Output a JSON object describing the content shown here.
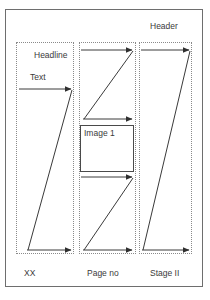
{
  "diagram": {
    "title_label": "Header",
    "frame": {
      "name": "page-frame"
    },
    "columns": [
      {
        "id": "left",
        "bottom_label": "XX",
        "inner_labels": [
          "Headline",
          "Text"
        ]
      },
      {
        "id": "middle",
        "bottom_label": "Page no",
        "inner_labels": [
          "Image 1"
        ]
      },
      {
        "id": "right",
        "bottom_label": "Stage II",
        "inner_labels": []
      }
    ],
    "labels": {
      "header": "Header",
      "headline": "Headline",
      "text": "Text",
      "image_1": "Image 1",
      "bottom_left": "XX",
      "bottom_middle": "Page no",
      "bottom_right": "Stage II"
    },
    "colors": {
      "frame_stroke": "#6e6e6e",
      "column_stroke": "#8a8a8a",
      "arrow_stroke": "#3a3a3a",
      "box_stroke": "#4a4a4a",
      "text": "#3a3a3a",
      "background": "#ffffff"
    }
  }
}
